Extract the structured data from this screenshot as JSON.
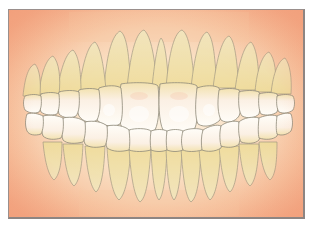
{
  "image": {
    "subject": "dental-illustration-full-dentition",
    "description": "Frontal illustration of upper and lower teeth with roots visible through translucent gums and bone",
    "colors": {
      "background": "#ffffff",
      "gum_edge": "#f4ad8a",
      "gum_center": "#fbe6cf",
      "bone": "#f3dcb5",
      "enamel": "#fdfbf4",
      "dentin": "#f1e3a8",
      "outline": "#8f8a7a",
      "frame_border": "#9a8f8c"
    }
  }
}
